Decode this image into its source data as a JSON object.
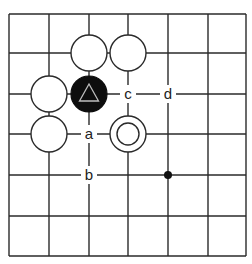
{
  "diagram": {
    "type": "go-board-fragment",
    "grid": {
      "cols": 7,
      "rows": 7,
      "x": [
        9,
        49,
        89,
        128,
        168,
        208,
        246
      ],
      "y": [
        14,
        53,
        94,
        134,
        175,
        216,
        256
      ],
      "line_color": "#2a2a2a",
      "background": "#ffffff"
    },
    "stones": [
      {
        "color": "white",
        "col": 2,
        "row": 1
      },
      {
        "color": "white",
        "col": 3,
        "row": 1
      },
      {
        "color": "white",
        "col": 1,
        "row": 2
      },
      {
        "color": "black",
        "col": 2,
        "row": 2,
        "marker": "triangle"
      },
      {
        "color": "white",
        "col": 1,
        "row": 3
      },
      {
        "color": "white",
        "col": 3,
        "row": 3,
        "marker": "circle"
      }
    ],
    "labels": [
      {
        "text": "c",
        "col": 3,
        "row": 2
      },
      {
        "text": "d",
        "col": 4,
        "row": 2
      },
      {
        "text": "a",
        "col": 2,
        "row": 3
      },
      {
        "text": "b",
        "col": 2,
        "row": 4
      }
    ],
    "hoshi": [
      {
        "col": 4,
        "row": 4
      }
    ],
    "stone_radius": 18
  }
}
